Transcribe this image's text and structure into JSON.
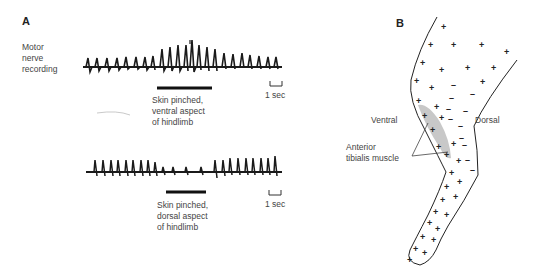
{
  "panel_a": {
    "label": "A",
    "y_label": [
      "Motor",
      "nerve",
      "recording"
    ],
    "trace_1": {
      "stimulus_caption": [
        "Skin pinched,",
        "ventral aspect",
        "of hindlimb"
      ],
      "scale_bar": "1 sec"
    },
    "trace_2": {
      "stimulus_caption": [
        "Skin pinched,",
        "dorsal aspect",
        "of hindlimb"
      ],
      "scale_bar": "1 sec"
    }
  },
  "panel_b": {
    "label": "B",
    "side_left": "Ventral",
    "side_right": "Dorsal",
    "muscle_label": [
      "Anterior",
      "tibialis muscle"
    ],
    "legend_symbols": {
      "excitatory": "+",
      "inhibitory": "–"
    },
    "muscle_color": "#c8c8c8"
  }
}
